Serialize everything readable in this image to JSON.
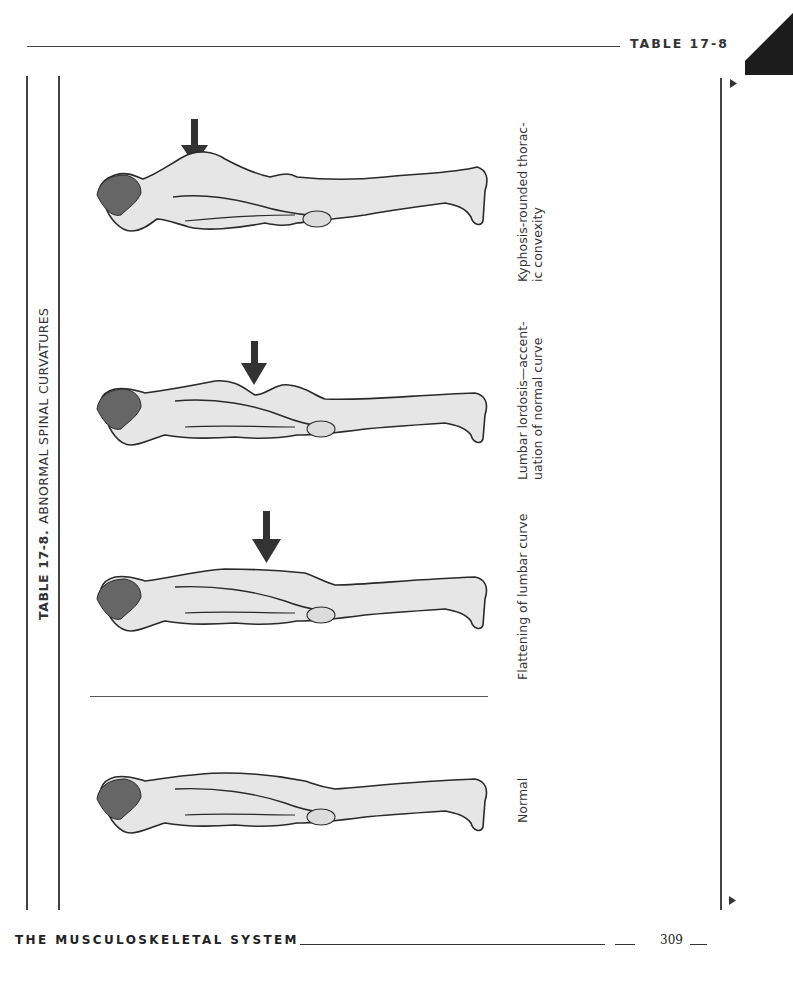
{
  "header": {
    "running_title": "TABLE 17-8"
  },
  "table": {
    "number_label": "TABLE 17-8.",
    "title": "ABNORMAL SPINAL CURVATURES",
    "figures": [
      {
        "id": "kyphosis",
        "caption_lines": [
          "Kyphosis-rounded  thorac-",
          "ic convexity"
        ],
        "arrow": true
      },
      {
        "id": "lordosis",
        "caption_lines": [
          "Lumbar  lordosis—accent-",
          "uation  of  normal  curve"
        ],
        "arrow": true
      },
      {
        "id": "flattening",
        "caption_lines": [
          "Flattening of lumbar curve"
        ],
        "arrow": true
      },
      {
        "id": "normal",
        "caption_lines": [
          "Normal"
        ],
        "arrow": false
      }
    ]
  },
  "footer": {
    "section_title": "THE MUSCULOSKELETAL SYSTEM",
    "page_number": "309"
  },
  "colors": {
    "ink": "#222222",
    "rule": "#444444",
    "figure_fill": "#e6e6e6",
    "figure_stroke": "#2a2a2a"
  }
}
